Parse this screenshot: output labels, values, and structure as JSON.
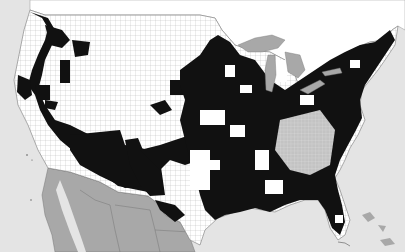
{
  "map": {
    "title": "",
    "subject": "US county choropleth (binary shading)",
    "colors": {
      "ocean": "#e4e4e4",
      "land_unshaded": "#ffffff",
      "county_shaded": "#111111",
      "mexico": "#a8a8a8",
      "lakes": "#a8a8a8",
      "border": "#8a8a8a"
    },
    "regions": [
      "Canada",
      "United States",
      "Mexico",
      "Great Lakes",
      "Gulf of Mexico",
      "Pacific Ocean",
      "Atlantic Ocean"
    ],
    "legend": []
  }
}
